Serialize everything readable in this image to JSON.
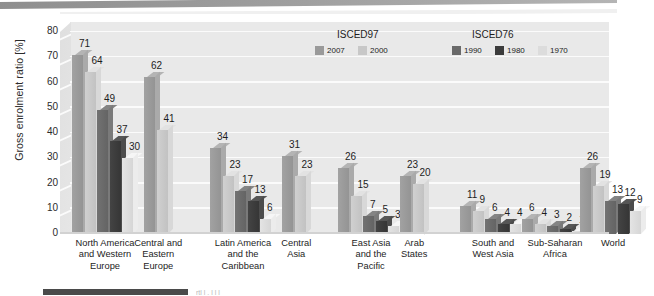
{
  "chart_data": {
    "type": "bar",
    "title": "",
    "xlabel": "",
    "ylabel": "Gross enrolment ratio [%]",
    "ylim": [
      0,
      80
    ],
    "yticks": [
      0,
      10,
      20,
      30,
      40,
      50,
      60,
      70,
      80
    ],
    "grid": true,
    "legend_position": "top",
    "legend_groups": [
      {
        "title": "ISCED97",
        "entries": [
          {
            "name": "2007",
            "color": "#9a9a9a"
          },
          {
            "name": "2000",
            "color": "#c8c8c8"
          }
        ]
      },
      {
        "title": "ISCED76",
        "entries": [
          {
            "name": "1990",
            "color": "#6a6a6a"
          },
          {
            "name": "1980",
            "color": "#3c3c3c"
          },
          {
            "name": "1970",
            "color": "#dcdcdc"
          }
        ]
      }
    ],
    "categories": [
      "North America and Western Europe",
      "Central and Eastern Europe",
      "Latin America and the Caribbean",
      "Central Asia",
      "East Asia and the Pacific",
      "Arab States",
      "South and West Asia",
      "Sub-Saharan Africa",
      "World"
    ],
    "category_lines": [
      [
        "North America",
        "and Western",
        "Europe"
      ],
      [
        "Central and",
        "Eastern",
        "Europe"
      ],
      [
        "Latin America",
        "and the",
        "Caribbean"
      ],
      [
        "Central",
        "Asia"
      ],
      [
        "East Asia",
        "and the",
        "Pacific"
      ],
      [
        "Arab",
        "States"
      ],
      [
        "South and",
        "West Asia"
      ],
      [
        "Sub-Saharan",
        "Africa"
      ],
      [
        "World"
      ]
    ],
    "series": [
      {
        "name": "2007",
        "color": "#9a9a9a",
        "values": [
          71,
          62,
          34,
          31,
          26,
          23,
          11,
          6,
          26
        ]
      },
      {
        "name": "2000",
        "color": "#c8c8c8",
        "values": [
          64,
          41,
          23,
          23,
          15,
          20,
          9,
          4,
          19
        ]
      },
      {
        "name": "1990",
        "color": "#6a6a6a",
        "values": [
          49,
          null,
          17,
          null,
          7,
          null,
          6,
          3,
          13
        ]
      },
      {
        "name": "1980",
        "color": "#3c3c3c",
        "values": [
          37,
          null,
          13,
          null,
          5,
          null,
          4,
          2,
          12
        ]
      },
      {
        "name": "1970",
        "color": "#dcdcdc",
        "values": [
          30,
          null,
          6,
          null,
          3,
          null,
          4,
          1,
          9
        ]
      }
    ]
  },
  "decor": {
    "bottom_note": "rtl    l  .  l      l       l"
  }
}
